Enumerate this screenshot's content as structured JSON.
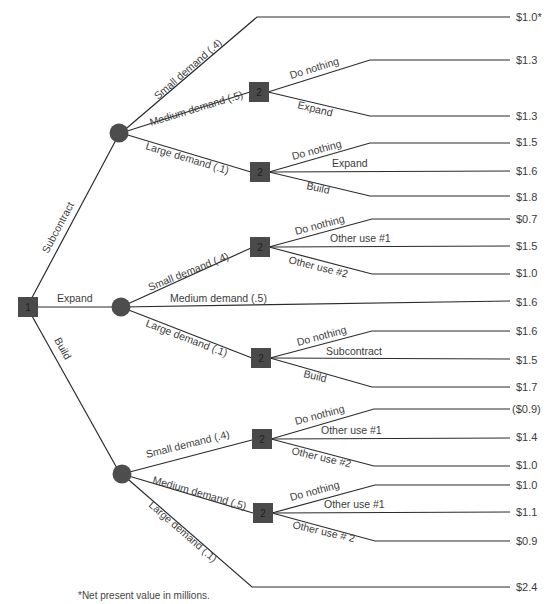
{
  "diagram": {
    "type": "decision-tree",
    "footnote": "*Net present value in millions.",
    "root": {
      "id": "1",
      "label": "1"
    },
    "decision_node_label": "2",
    "first_decisions": [
      {
        "label": "Subcontract",
        "outcomes": [
          {
            "label": "Small demand",
            "prob": "(.4)",
            "value": "$1.0*"
          },
          {
            "label": "Medium demand",
            "prob": "(.5)",
            "decision": "2",
            "options": [
              {
                "label": "Do nothing",
                "value": "$1.3"
              },
              {
                "label": "Expand",
                "value": "$1.3"
              }
            ]
          },
          {
            "label": "Large demand",
            "prob": "(.1)",
            "decision": "2",
            "options": [
              {
                "label": "Do nothing",
                "value": "$1.5"
              },
              {
                "label": "Expand",
                "value": "$1.6"
              },
              {
                "label": "Build",
                "value": "$1.8"
              }
            ]
          }
        ]
      },
      {
        "label": "Expand",
        "outcomes": [
          {
            "label": "Small demand",
            "prob": "(.4)",
            "decision": "2",
            "options": [
              {
                "label": "Do nothing",
                "value": "$0.7"
              },
              {
                "label": "Other use #1",
                "value": "$1.5"
              },
              {
                "label": "Other use #2",
                "value": "$1.0"
              }
            ]
          },
          {
            "label": "Medium demand",
            "prob": "(.5)",
            "value": "$1.6"
          },
          {
            "label": "Large demand",
            "prob": "(.1)",
            "decision": "2",
            "options": [
              {
                "label": "Do nothing",
                "value": "$1.6"
              },
              {
                "label": "Subcontract",
                "value": "$1.5"
              },
              {
                "label": "Build",
                "value": "$1.7"
              }
            ]
          }
        ]
      },
      {
        "label": "Build",
        "outcomes": [
          {
            "label": "Small demand",
            "prob": "(.4)",
            "decision": "2",
            "options": [
              {
                "label": "Do nothing",
                "value": "($0.9)"
              },
              {
                "label": "Other use #1",
                "value": "$1.4"
              },
              {
                "label": "Other use #2",
                "value": "$1.0"
              }
            ]
          },
          {
            "label": "Medium demand",
            "prob": "(.5)",
            "decision": "2",
            "options": [
              {
                "label": "Do nothing",
                "value": "$1.0"
              },
              {
                "label": "Other use #1",
                "value": "$1.1"
              },
              {
                "label": "Other use # 2",
                "value": "$0.9"
              }
            ]
          },
          {
            "label": "Large demand",
            "prob": "(.1)",
            "value": "$2.4"
          }
        ]
      }
    ]
  },
  "labels": {
    "subcontract": "Subcontract",
    "expand": "Expand",
    "build": "Build",
    "s_small": "Small demand   (.4)",
    "s_medium": "Medium demand  (.5)",
    "s_large": "Large demand  (.1)",
    "e_small": "Small demand   (.4)",
    "e_medium": "Medium demand (.5)",
    "e_large": "Large  demand    (.1)",
    "b_small": "Small  demand    (.4)",
    "b_medium": "Medium demand  (.5)",
    "b_large": "Large  demand    (.1)",
    "do_nothing": "Do nothing",
    "expand_opt": "Expand",
    "build_opt": "Build",
    "subcontract_opt": "Subcontract",
    "other1": "Other use #1",
    "other2": "Other use #2",
    "other2b": "Other use # 2"
  },
  "values": [
    "$1.0*",
    "$1.3",
    "$1.3",
    "$1.5",
    "$1.6",
    "$1.8",
    "$0.7",
    "$1.5",
    "$1.0",
    "$1.6",
    "$1.6",
    "$1.5",
    "$1.7",
    "($0.9)",
    "$1.4",
    "$1.0",
    "$1.0",
    "$1.1",
    "$0.9",
    "$2.4"
  ]
}
